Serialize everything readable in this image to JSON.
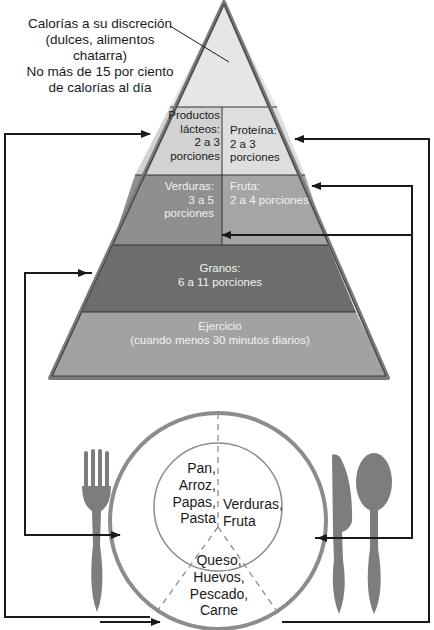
{
  "diagram": {
    "title_note": {
      "line1": "Calorías a su discreción",
      "line2": "(dulces, alimentos",
      "line3": "chatarra)",
      "line4": "No más de 15 por ciento",
      "line5": "de calorías al día"
    },
    "pyramid": {
      "dairy": {
        "l1": "Productos",
        "l2": "lácteos:",
        "l3": "2 a 3",
        "l4": "porciones"
      },
      "protein": {
        "l1": "Proteína:",
        "l2": "2 a 3",
        "l3": "porciones"
      },
      "vegetables": {
        "l1": "Verduras:",
        "l2": "3 a 5",
        "l3": "porciones"
      },
      "fruit": {
        "l1": "Fruta:",
        "l2": "2 a 4 porciones"
      },
      "grains": {
        "l1": "Granos:",
        "l2": "6 a 11 porciones"
      },
      "exercise": {
        "l1": "Ejercicio",
        "l2": "(cuando menos 30 minutos diarios)"
      }
    },
    "plate": {
      "grains_section": {
        "l1": "Pan,",
        "l2": "Arroz,",
        "l3": "Papas,",
        "l4": "Pasta"
      },
      "produce_section": {
        "l1": "Verduras,",
        "l2": "Fruta"
      },
      "protein_section": {
        "l1": "Queso,",
        "l2": "Huevos,",
        "l3": "Pescado,",
        "l4": "Carne"
      }
    },
    "colors": {
      "top_tier": "#e6e6e6",
      "dairy_protein_tier": "#d4d4d4",
      "veg_fruit_tier": "#9a9a9a",
      "grains_tier": "#6e6e6e",
      "exercise_tier": "#a3a3a3",
      "pyramid_border": "#7a7a7a",
      "utensils": "#7d7d7d",
      "plate": "#8c8c8c",
      "arrows": "#1a1a1a"
    },
    "icons": [
      "fork-icon",
      "knife-icon",
      "spoon-icon",
      "plate-icon",
      "arrow-icon"
    ]
  }
}
